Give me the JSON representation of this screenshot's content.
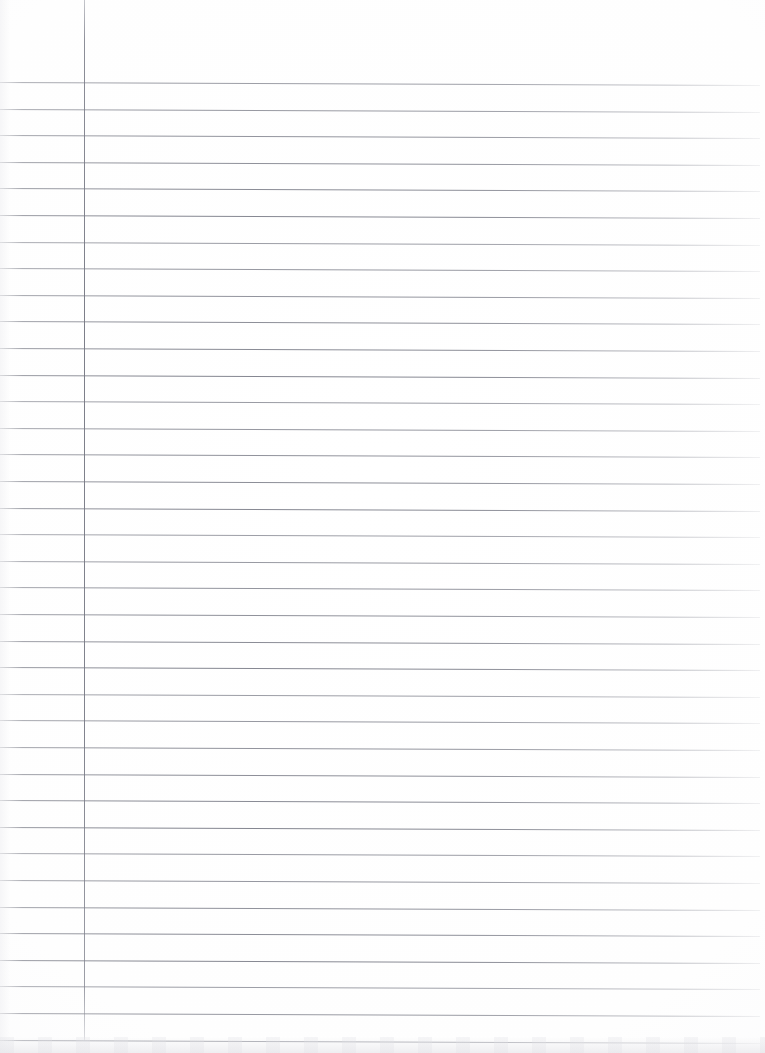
{
  "document": {
    "type": "scanned-ruled-notebook-paper",
    "title": "Blank lined notebook page",
    "page_width": 765,
    "page_height": 1053,
    "background_color": "#ffffff",
    "content_text": "",
    "is_blank": true
  },
  "paper": {
    "rule_color": "#7a7c85",
    "margin_rule_color": "#767881",
    "rule_count": 37,
    "first_rule_y": 82,
    "rule_spacing": 26.6,
    "rule_start_x": 0,
    "rule_end_x": 760,
    "rule_tilt_degrees": 0.22,
    "margin_rule_x": 84,
    "margin_rule_top": 0,
    "margin_rule_bottom": 1040
  }
}
